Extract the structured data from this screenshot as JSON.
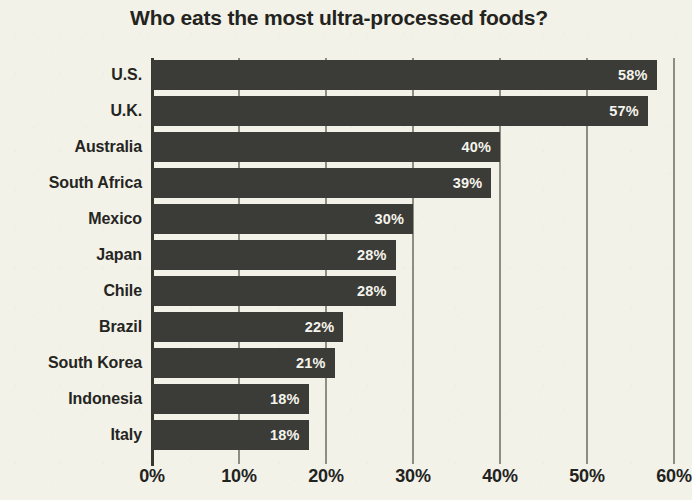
{
  "chart_data": {
    "type": "bar",
    "orientation": "horizontal",
    "title": "Who eats the most ultra-processed foods?",
    "xlabel": "",
    "ylabel": "",
    "categories": [
      "U.S.",
      "U.K.",
      "Australia",
      "South Africa",
      "Mexico",
      "Japan",
      "Chile",
      "Brazil",
      "South Korea",
      "Indonesia",
      "Italy"
    ],
    "values": [
      58,
      57,
      40,
      39,
      30,
      28,
      28,
      22,
      21,
      18,
      18
    ],
    "value_labels": [
      "58%",
      "57%",
      "40%",
      "39%",
      "30%",
      "28%",
      "28%",
      "22%",
      "21%",
      "18%",
      "18%"
    ],
    "xlim": [
      0,
      60
    ],
    "xticks": [
      0,
      10,
      20,
      30,
      40,
      50,
      60
    ],
    "xtick_labels": [
      "0%",
      "10%",
      "20%",
      "30%",
      "40%",
      "50%",
      "60%"
    ],
    "grid": true,
    "legend": false,
    "colors": {
      "background": "#f3f2e9",
      "bar": "#3b3b37",
      "bar_label_text": "#f5f4ec",
      "axis_text": "#23231e",
      "gridline": "#8d8d84",
      "axis_line": "#37372f",
      "title_text": "#232320"
    }
  }
}
